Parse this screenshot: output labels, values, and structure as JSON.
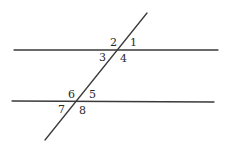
{
  "diagram": {
    "type": "parallel-lines-cut-by-transversal",
    "colors": {
      "line": "#3a3a3a",
      "label": "#2a2a2a",
      "background": "#ffffff"
    },
    "lines": {
      "top_parallel": {
        "x1": 14,
        "y1": 50,
        "x2": 218,
        "y2": 50
      },
      "bottom_parallel": {
        "x1": 12,
        "y1": 101,
        "x2": 214,
        "y2": 102
      },
      "transversal": {
        "x1": 147,
        "y1": 13,
        "x2": 45,
        "y2": 140
      }
    },
    "intersections": [
      {
        "name": "upper",
        "x": 117,
        "y": 50
      },
      {
        "name": "lower",
        "x": 78,
        "y": 101
      }
    ],
    "angle_labels": [
      {
        "text": "1",
        "x": 130,
        "y": 46
      },
      {
        "text": "2",
        "x": 110,
        "y": 46
      },
      {
        "text": "3",
        "x": 99,
        "y": 61
      },
      {
        "text": "4",
        "x": 120,
        "y": 62
      },
      {
        "text": "5",
        "x": 89,
        "y": 98
      },
      {
        "text": "6",
        "x": 68,
        "y": 98
      },
      {
        "text": "7",
        "x": 58,
        "y": 113
      },
      {
        "text": "8",
        "x": 79,
        "y": 114
      }
    ]
  }
}
